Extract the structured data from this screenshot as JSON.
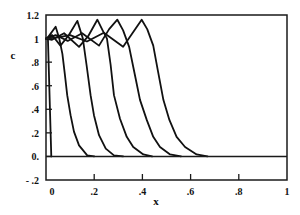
{
  "chart_data": {
    "type": "line",
    "title": "",
    "xlabel": "x",
    "ylabel": "c",
    "xlim": [
      0,
      1
    ],
    "ylim": [
      -0.2,
      1.2
    ],
    "grid": false,
    "legend": null,
    "x_ticks": [
      {
        "value": 0,
        "label": "0"
      },
      {
        "value": 0.2,
        "label": ".2"
      },
      {
        "value": 0.4,
        "label": ".4"
      },
      {
        "value": 0.6,
        "label": ".6"
      },
      {
        "value": 0.8,
        "label": ".8"
      },
      {
        "value": 1,
        "label": "1"
      }
    ],
    "y_ticks": [
      {
        "value": 1.2,
        "label": "1.2"
      },
      {
        "value": 1,
        "label": "1"
      },
      {
        "value": 0.8,
        "label": ".8"
      },
      {
        "value": 0.6,
        "label": ".6"
      },
      {
        "value": 0.4,
        "label": ".4"
      },
      {
        "value": 0.2,
        "label": ".2"
      },
      {
        "value": 0,
        "label": "0."
      },
      {
        "value": -0.2,
        "label": "- .2"
      }
    ],
    "reference_lines": [
      {
        "axis": "y",
        "value": 0
      }
    ],
    "series": [
      {
        "name": "profile 0",
        "points": [
          [
            0,
            1.0
          ],
          [
            0.008,
            1.0
          ],
          [
            0.022,
            0
          ]
        ]
      },
      {
        "name": "profile 1",
        "points": [
          [
            0,
            1.0
          ],
          [
            0.008,
            1.01
          ],
          [
            0.04,
            1.1
          ],
          [
            0.055,
            1.0
          ],
          [
            0.068,
            0.87
          ],
          [
            0.078,
            0.7
          ],
          [
            0.088,
            0.52
          ],
          [
            0.102,
            0.35
          ],
          [
            0.116,
            0.21
          ],
          [
            0.137,
            0.094
          ],
          [
            0.171,
            0.009
          ],
          [
            0.2,
            0
          ]
        ]
      },
      {
        "name": "profile 2",
        "points": [
          [
            0,
            1.0
          ],
          [
            0.025,
            1.03
          ],
          [
            0.06,
            0.94
          ],
          [
            0.095,
            1.03
          ],
          [
            0.13,
            1.15
          ],
          [
            0.153,
            1.0
          ],
          [
            0.168,
            0.78
          ],
          [
            0.185,
            0.52
          ],
          [
            0.199,
            0.35
          ],
          [
            0.22,
            0.18
          ],
          [
            0.248,
            0.066
          ],
          [
            0.282,
            0.009
          ],
          [
            0.32,
            0
          ]
        ]
      },
      {
        "name": "profile 3",
        "points": [
          [
            0,
            1.0
          ],
          [
            0.025,
            0.99
          ],
          [
            0.075,
            1.045
          ],
          [
            0.137,
            0.93
          ],
          [
            0.175,
            1.02
          ],
          [
            0.213,
            1.16
          ],
          [
            0.235,
            1.07
          ],
          [
            0.253,
            1.0
          ],
          [
            0.268,
            0.78
          ],
          [
            0.282,
            0.52
          ],
          [
            0.307,
            0.32
          ],
          [
            0.335,
            0.166
          ],
          [
            0.362,
            0.08
          ],
          [
            0.404,
            0.017
          ],
          [
            0.44,
            0
          ]
        ]
      },
      {
        "name": "profile 4",
        "points": [
          [
            0,
            1.0
          ],
          [
            0.04,
            1.03
          ],
          [
            0.09,
            0.98
          ],
          [
            0.15,
            1.045
          ],
          [
            0.22,
            0.94
          ],
          [
            0.262,
            1.08
          ],
          [
            0.296,
            1.16
          ],
          [
            0.32,
            1.07
          ],
          [
            0.345,
            0.93
          ],
          [
            0.37,
            0.68
          ],
          [
            0.39,
            0.48
          ],
          [
            0.418,
            0.31
          ],
          [
            0.445,
            0.166
          ],
          [
            0.473,
            0.08
          ],
          [
            0.515,
            0.017
          ],
          [
            0.56,
            0
          ]
        ]
      },
      {
        "name": "profile 5",
        "points": [
          [
            0,
            1.0
          ],
          [
            0.05,
            1.01
          ],
          [
            0.1,
            1.03
          ],
          [
            0.17,
            0.975
          ],
          [
            0.24,
            1.05
          ],
          [
            0.32,
            0.93
          ],
          [
            0.397,
            1.16
          ],
          [
            0.42,
            1.08
          ],
          [
            0.445,
            0.94
          ],
          [
            0.465,
            0.72
          ],
          [
            0.487,
            0.48
          ],
          [
            0.512,
            0.31
          ],
          [
            0.542,
            0.166
          ],
          [
            0.577,
            0.08
          ],
          [
            0.625,
            0.017
          ],
          [
            0.67,
            0
          ]
        ]
      }
    ]
  }
}
